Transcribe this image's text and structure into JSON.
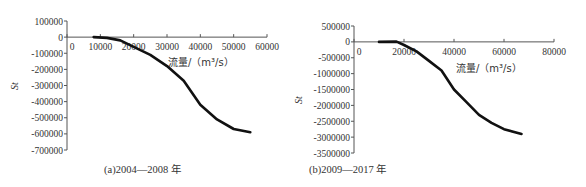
{
  "chart_data": [
    {
      "type": "line",
      "title": "",
      "caption": "(a)2004—2008 年",
      "xlabel": "流量/（m³/s）",
      "ylabel": "S_t",
      "xlim": [
        0,
        60000
      ],
      "ylim": [
        -700000,
        100000
      ],
      "xticks": [
        0,
        10000,
        20000,
        30000,
        40000,
        50000,
        60000
      ],
      "xtick_labels": [
        "0",
        "10000",
        "20000",
        "30000",
        "40000",
        "50000",
        "60000"
      ],
      "yticks": [
        100000,
        0,
        -100000,
        -200000,
        -300000,
        -400000,
        -500000,
        -600000,
        -700000
      ],
      "ytick_labels": [
        "100000",
        "0",
        "-100000",
        "-200000",
        "-300000",
        "-400000",
        "-500000",
        "-600000",
        "-700000"
      ],
      "grid": false,
      "legend": null,
      "series": [
        {
          "name": "S_t",
          "x": [
            8000,
            12000,
            16000,
            20000,
            25000,
            30000,
            35000,
            40000,
            45000,
            50000,
            55000
          ],
          "y": [
            0,
            -5000,
            -20000,
            -60000,
            -110000,
            -180000,
            -270000,
            -420000,
            -510000,
            -570000,
            -590000
          ]
        }
      ]
    },
    {
      "type": "line",
      "title": "",
      "caption": "(b)2009—2017 年",
      "xlabel": "流量/（m³/s）",
      "ylabel": "S_t",
      "xlim": [
        0,
        80000
      ],
      "ylim": [
        -3500000,
        500000
      ],
      "xticks": [
        0,
        20000,
        40000,
        60000,
        80000
      ],
      "xtick_labels": [
        "0",
        "20000",
        "40000",
        "60000",
        "80000"
      ],
      "yticks": [
        500000,
        0,
        -500000,
        -1000000,
        -1500000,
        -2000000,
        -2500000,
        -3000000,
        -3500000
      ],
      "ytick_labels": [
        "500000",
        "0",
        "-500000",
        "-1000000",
        "-1500000",
        "-2000000",
        "-2500000",
        "-3000000",
        "-3500000"
      ],
      "grid": false,
      "legend": null,
      "series": [
        {
          "name": "S_t",
          "x": [
            10000,
            17000,
            20000,
            25000,
            30000,
            35000,
            40000,
            45000,
            50000,
            55000,
            60000,
            67000
          ],
          "y": [
            0,
            10000,
            -100000,
            -300000,
            -600000,
            -900000,
            -1500000,
            -1900000,
            -2300000,
            -2550000,
            -2750000,
            -2900000
          ]
        }
      ]
    }
  ],
  "captions": {
    "a": "(a)2004—2008 年",
    "b": "(b)2009—2017 年"
  }
}
